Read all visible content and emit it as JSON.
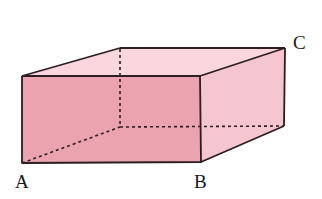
{
  "diagram": {
    "type": "rectangular-prism",
    "labels": {
      "A": "A",
      "B": "B",
      "C": "C"
    },
    "colors": {
      "front_face": "#eca3b0",
      "right_face": "#f6c6d0",
      "top_face": "#fad6de",
      "edge": "#2a1e22",
      "background": "#ffffff"
    },
    "vertices": {
      "front_top_left": [
        22,
        76
      ],
      "front_top_right": [
        200,
        76
      ],
      "front_bottom_left": [
        22,
        163
      ],
      "front_bottom_right": [
        201,
        162
      ],
      "back_top_left": [
        120,
        48
      ],
      "back_top_right": [
        285,
        48
      ],
      "back_bottom_left": [
        120,
        127
      ],
      "back_bottom_right": [
        284,
        126
      ]
    }
  }
}
